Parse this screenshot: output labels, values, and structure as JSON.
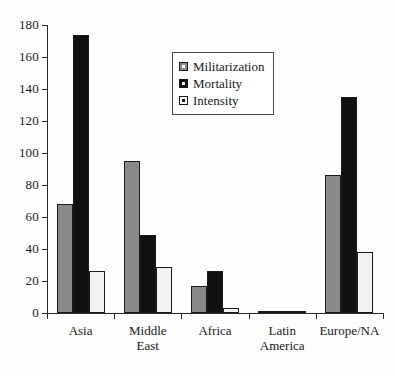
{
  "chart_data": {
    "type": "bar",
    "title": "",
    "subtitle": "",
    "xlabel": "",
    "ylabel": "",
    "ylim": [
      0,
      180
    ],
    "ytick_step": 20,
    "yticks": [
      0,
      20,
      40,
      60,
      80,
      100,
      120,
      140,
      160,
      180
    ],
    "ytick_labels": [
      "0",
      "20",
      "40",
      "60",
      "80",
      "100",
      "120",
      "140",
      "160",
      "180"
    ],
    "grid": false,
    "legend_position": "upper-center",
    "categories": [
      "Asia",
      "Middle\nEast",
      "Africa",
      "Latin\nAmerica",
      "Europe/NA"
    ],
    "category_labels": [
      "Asia",
      "Middle East",
      "Africa",
      "Latin America",
      "Europe/NA"
    ],
    "series": [
      {
        "name": "Militarization",
        "color": "#8a8a8a",
        "values": [
          68,
          95,
          17,
          1,
          86
        ]
      },
      {
        "name": "Mortality",
        "color": "#111111",
        "values": [
          174,
          49,
          26,
          1,
          135
        ]
      },
      {
        "name": "Intensity",
        "color": "#f2f2f0",
        "values": [
          26,
          29,
          3,
          1,
          38
        ]
      }
    ]
  },
  "legend": {
    "items": [
      {
        "label": "Militarization",
        "swatch": "militarization"
      },
      {
        "label": "Mortality",
        "swatch": "mortality"
      },
      {
        "label": "Intensity",
        "swatch": "intensity"
      }
    ]
  },
  "axis": {
    "y_max_label": "180",
    "y_min_label": "0"
  }
}
